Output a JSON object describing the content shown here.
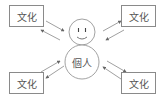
{
  "diagram": {
    "boxes": [
      {
        "id": "top-left",
        "label": "文化"
      },
      {
        "id": "top-right",
        "label": "文化"
      },
      {
        "id": "bottom-left",
        "label": "文化"
      },
      {
        "id": "bottom-right",
        "label": "文化"
      }
    ],
    "center": {
      "label": "個人",
      "head": "smiley-face",
      "description": "person figure with smiling head"
    },
    "arrows": "bidirectional arrow pairs between each 文化 box and the person",
    "colors": {
      "stroke": "#8a8a8a",
      "text": "#555555",
      "background": "#ffffff"
    }
  }
}
